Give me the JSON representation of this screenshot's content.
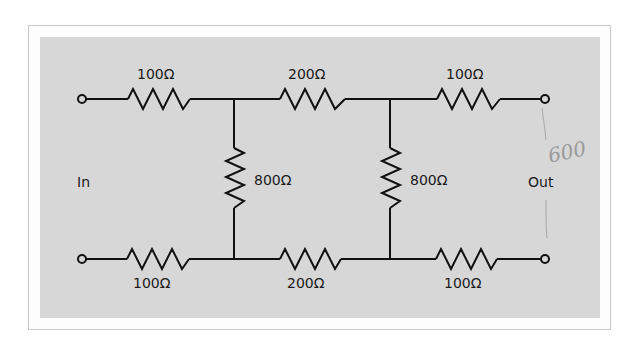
{
  "diagram": {
    "type": "resistor ladder network (two-section)",
    "colors": {
      "background": "#ffffff",
      "panel": "#d7d7d7",
      "wire": "#111111",
      "annotation": "#9a9a9a"
    },
    "ports": {
      "input_label": "In",
      "output_label": "Out"
    },
    "top_rail": [
      {
        "id": "R1",
        "label": "100Ω"
      },
      {
        "id": "R2",
        "label": "200Ω"
      },
      {
        "id": "R3",
        "label": "100Ω"
      }
    ],
    "shunts": [
      {
        "id": "R4",
        "label": "800Ω"
      },
      {
        "id": "R5",
        "label": "800Ω"
      }
    ],
    "bottom_rail": [
      {
        "id": "R6",
        "label": "100Ω"
      },
      {
        "id": "R7",
        "label": "200Ω"
      },
      {
        "id": "R8",
        "label": "100Ω"
      }
    ],
    "handwritten_note": "600"
  }
}
